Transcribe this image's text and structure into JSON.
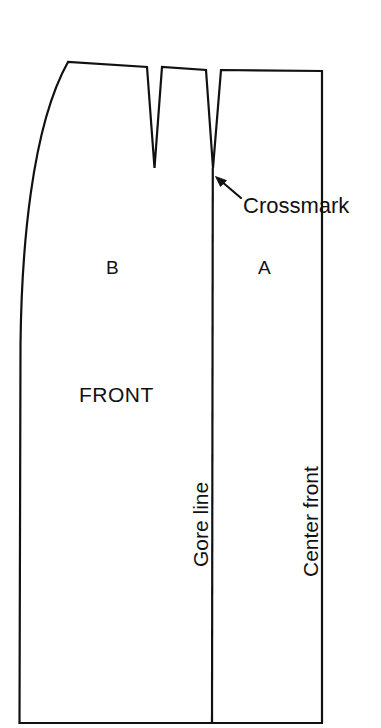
{
  "diagram": {
    "type": "sewing-pattern-schematic",
    "line_color": "#111111",
    "fill_color": "#ffffff",
    "background_color": "#ffffff",
    "labels": {
      "crossmark": "Crossmark",
      "panel_a": "A",
      "panel_b": "B",
      "front": "FRONT",
      "gore_line": "Gore line",
      "center_front": "Center front"
    },
    "annotations": {
      "arrow": {
        "name": "crossmark-arrow",
        "points_to": "Crossmark",
        "tip": [
          216,
          177
        ],
        "tail": [
          241,
          198
        ]
      }
    },
    "geometry": {
      "outline_path": "M 19,723 L 19,300 C 19,210 28,120 68,62 L 147,67 L 154,168 L 162,67 L 206,70 L 213,168 L 221,70 L 322,71 L 322,723 Z",
      "gore_line": {
        "x1": 213,
        "y1": 168,
        "x2": 212,
        "y2": 723
      },
      "darts": [
        {
          "name": "dart-1",
          "left_top": [
            147,
            67
          ],
          "point": [
            154,
            168
          ],
          "right_top": [
            162,
            67
          ]
        },
        {
          "name": "dart-2",
          "left_top": [
            206,
            70
          ],
          "point": [
            213,
            168
          ],
          "right_top": [
            221,
            70
          ]
        }
      ],
      "center_front_edge": {
        "x1": 322,
        "y1": 71,
        "x2": 322,
        "y2": 723
      },
      "hem_edge": {
        "x1": 19,
        "y1": 723,
        "x2": 322,
        "y2": 723
      }
    }
  }
}
